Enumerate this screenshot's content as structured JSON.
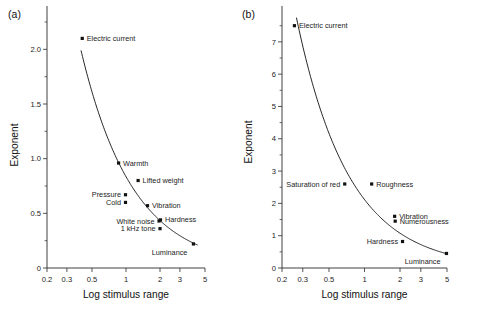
{
  "figure": {
    "panels": [
      {
        "key": "a",
        "label": "(a)",
        "xlabel": "Log stimulus range",
        "ylabel": "Exponent"
      },
      {
        "key": "b",
        "label": "(b)",
        "xlabel": "Log stimulus range",
        "ylabel": "Exponent"
      }
    ]
  },
  "chart_data": [
    {
      "panel": "a",
      "type": "scatter",
      "title": "",
      "xlabel": "Log stimulus range",
      "ylabel": "Exponent",
      "xscale": "log",
      "xlim": [
        0.2,
        5
      ],
      "ylim": [
        0,
        2.25
      ],
      "xticks": [
        0.2,
        0.3,
        0.5,
        1,
        2,
        3,
        5
      ],
      "xticklabels": [
        "0.2",
        "0.3",
        "0.5",
        "1",
        "2",
        "3",
        "5"
      ],
      "yticks": [
        0,
        0.5,
        1.0,
        1.5,
        2.0
      ],
      "yticklabels": [
        "0",
        "0.5",
        "1.0",
        "1.5",
        "2.0"
      ],
      "yminorticks": [
        0.25,
        0.75,
        1.25,
        1.75,
        2.25
      ],
      "grid": false,
      "legend": "none",
      "points": [
        {
          "label": "Electric current",
          "x": 0.41,
          "y": 2.1,
          "label_pos": "right"
        },
        {
          "label": "Warmth",
          "x": 0.86,
          "y": 0.96,
          "label_pos": "right"
        },
        {
          "label": "Lifted weight",
          "x": 1.28,
          "y": 0.8,
          "label_pos": "right"
        },
        {
          "label": "Pressure",
          "x": 0.99,
          "y": 0.67,
          "label_pos": "left"
        },
        {
          "label": "Cold",
          "x": 0.99,
          "y": 0.6,
          "label_pos": "left"
        },
        {
          "label": "Vibration",
          "x": 1.55,
          "y": 0.57,
          "label_pos": "right"
        },
        {
          "label": "Hardness",
          "x": 2.02,
          "y": 0.44,
          "label_pos": "right"
        },
        {
          "label": "White noise",
          "x": 1.96,
          "y": 0.43,
          "label_pos": "left"
        },
        {
          "label": "1 kHz tone",
          "x": 2.0,
          "y": 0.36,
          "label_pos": "left"
        },
        {
          "label": "Luminance",
          "x": 3.95,
          "y": 0.22,
          "label_pos": "belowleft"
        }
      ],
      "curve": {
        "form": "power",
        "description": "decreasing power fit",
        "x_start": 0.4,
        "x_end": 4.3,
        "y_start": 1.99,
        "y_end": 0.21
      }
    },
    {
      "panel": "b",
      "type": "scatter",
      "title": "",
      "xlabel": "Log stimulus range",
      "ylabel": "Exponent",
      "xscale": "log",
      "xlim": [
        0.2,
        5
      ],
      "ylim": [
        0,
        7.8
      ],
      "xticks": [
        0.2,
        0.3,
        0.5,
        1,
        2,
        3,
        5
      ],
      "xticklabels": [
        "0.2",
        "0.3",
        "0.5",
        "1",
        "2",
        "3",
        "5"
      ],
      "yticks": [
        0,
        1,
        2,
        3,
        4,
        5,
        6,
        7
      ],
      "yticklabels": [
        "0",
        "1",
        "2",
        "3",
        "4",
        "5",
        "6",
        "7"
      ],
      "yminorticks": [
        0.5,
        1.5,
        2.5,
        3.5,
        4.5,
        5.5,
        6.5,
        7.5
      ],
      "grid": false,
      "legend": "none",
      "points": [
        {
          "label": "Electric current",
          "x": 0.255,
          "y": 7.5,
          "label_pos": "right"
        },
        {
          "label": "Saturation of red",
          "x": 0.68,
          "y": 2.6,
          "label_pos": "left"
        },
        {
          "label": "Roughness",
          "x": 1.15,
          "y": 2.6,
          "label_pos": "right"
        },
        {
          "label": "Vibration",
          "x": 1.8,
          "y": 1.6,
          "label_pos": "right"
        },
        {
          "label": "Numerousness",
          "x": 1.82,
          "y": 1.45,
          "label_pos": "right"
        },
        {
          "label": "Hardness",
          "x": 2.1,
          "y": 0.82,
          "label_pos": "left"
        },
        {
          "label": "Luminance",
          "x": 4.95,
          "y": 0.45,
          "label_pos": "belowleft"
        }
      ],
      "curve": {
        "form": "power",
        "description": "decreasing power fit",
        "x_start": 0.265,
        "x_end": 5.0,
        "y_start": 7.75,
        "y_end": 0.44
      }
    }
  ]
}
